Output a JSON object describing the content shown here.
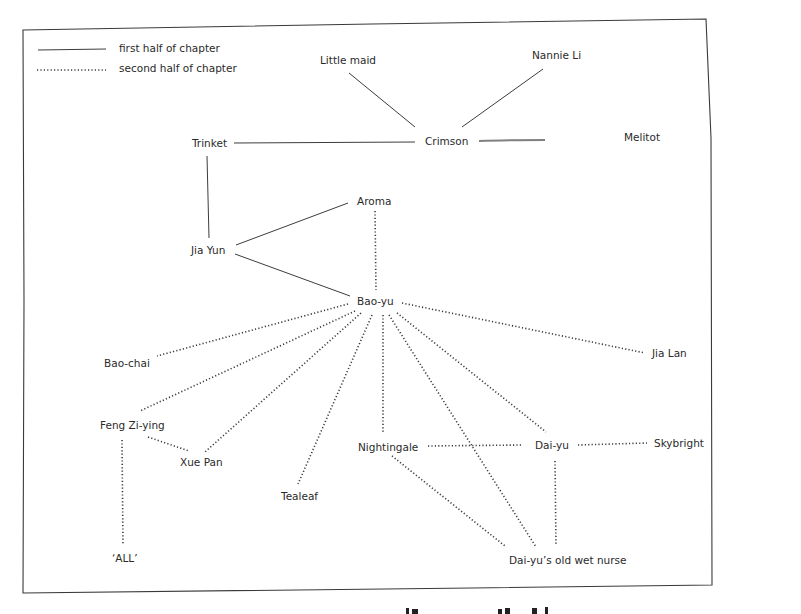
{
  "legend": {
    "items": [
      {
        "style": "solid",
        "label": "first half of chapter"
      },
      {
        "style": "dotted",
        "label": "second half of chapter"
      }
    ]
  },
  "nodes": {
    "little_maid": "Little maid",
    "nannie_li": "Nannie Li",
    "trinket": "Trinket",
    "crimson": "Crimson",
    "melitot": "Melitot",
    "aroma": "Aroma",
    "jia_yun": "Jia Yun",
    "bao_yu": "Bao-yu",
    "bao_chai": "Bao-chai",
    "jia_lan": "Jia Lan",
    "feng_zi_ying": "Feng Zi-ying",
    "xue_pan": "Xue Pan",
    "nightingale": "Nightingale",
    "dai_yu": "Dai-yu",
    "skybright": "Skybright",
    "tealeaf": "Tealeaf",
    "all": "‘ALL’",
    "wet_nurse": "Dai-yu’s old wet nurse"
  },
  "edges": {
    "first_half": [
      [
        "Little maid",
        "Crimson"
      ],
      [
        "Nannie Li",
        "Crimson"
      ],
      [
        "Trinket",
        "Crimson"
      ],
      [
        "Crimson",
        "Melitot"
      ],
      [
        "Trinket",
        "Jia Yun"
      ],
      [
        "Jia Yun",
        "Aroma"
      ],
      [
        "Jia Yun",
        "Bao-yu"
      ]
    ],
    "second_half": [
      [
        "Aroma",
        "Bao-yu"
      ],
      [
        "Bao-yu",
        "Bao-chai"
      ],
      [
        "Bao-yu",
        "Jia Lan"
      ],
      [
        "Bao-yu",
        "Feng Zi-ying"
      ],
      [
        "Bao-yu",
        "Xue Pan"
      ],
      [
        "Bao-yu",
        "Tealeaf"
      ],
      [
        "Bao-yu",
        "Nightingale"
      ],
      [
        "Bao-yu",
        "Dai-yu"
      ],
      [
        "Bao-yu",
        "Dai-yu's old wet nurse"
      ],
      [
        "Feng Zi-ying",
        "Xue Pan"
      ],
      [
        "Feng Zi-ying",
        "'ALL'"
      ],
      [
        "Nightingale",
        "Dai-yu"
      ],
      [
        "Nightingale",
        "Dai-yu's old wet nurse"
      ],
      [
        "Dai-yu",
        "Skybright"
      ],
      [
        "Dai-yu",
        "Dai-yu's old wet nurse"
      ]
    ]
  }
}
